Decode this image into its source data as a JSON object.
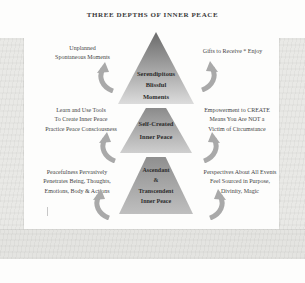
{
  "title": "THREE DEPTHS OF INNER PEACE",
  "levels": [
    {
      "label": "Serendipitous\nBlissful\nMoments",
      "left": "Unplanned\nSpontaneous Moments",
      "right": "Gifts to Receive * Enjoy"
    },
    {
      "label": "Self-Created\nInner Peace",
      "left": "Learn and Use Tools\nTo Create Inner Peace\nPractice Peace Consciousness",
      "right": "Empowerment to CREATE\nMeans You Are NOT a\nVictim of Circumstance"
    },
    {
      "label": "Ascendant\n&\nTranscendent\nInner Peace",
      "left": "Peacefulness Pervasively\nPenetrates Being, Thoughts,\nEmotions, Body & Actions",
      "right": "Perspectives About All Events\nFeel Sourced in Purpose,\nDivinity, Magic"
    }
  ],
  "icons": {
    "arrow": "curved-up-arrow"
  },
  "colors": {
    "title_text": "#3b3b3b",
    "side_text": "#454545",
    "pyramid_text": "#2d2d2d",
    "pyramid_gradient_top": "#6a6a6a",
    "pyramid_gradient_bottom": "#dcdcdc",
    "arrow": "#a9a9a9",
    "photo_margin": "#e9e9e6"
  }
}
